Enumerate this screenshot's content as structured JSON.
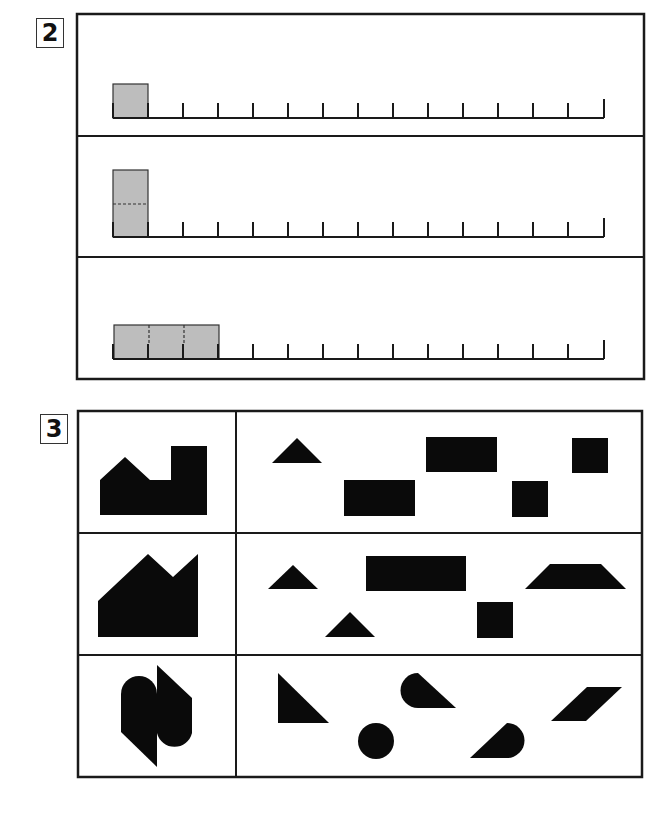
{
  "sections": [
    {
      "number": "2",
      "type": "unit-measurement",
      "rows": [
        {
          "ruler_ticks": 15,
          "tick_spacing_px": 35,
          "shaded_units_wide": 1,
          "shaded_height": "short",
          "dashed_dividers": "none",
          "description": "one shaded square on ruler"
        },
        {
          "ruler_ticks": 15,
          "tick_spacing_px": 35,
          "shaded_units_wide": 1,
          "shaded_height": "tall",
          "dashed_dividers": "horizontal at middle",
          "description": "tall rectangle made of two stacked units"
        },
        {
          "ruler_ticks": 15,
          "tick_spacing_px": 35,
          "shaded_units_wide": 3,
          "shaded_height": "short",
          "dashed_dividers": "two vertical",
          "description": "rectangle three units wide"
        }
      ],
      "colors": {
        "shade": "#bdbdbd",
        "line": "#1a1a1a"
      }
    },
    {
      "number": "3",
      "type": "shape-composition",
      "rows": [
        {
          "target": "house-with-tower silhouette",
          "pieces": [
            "triangle",
            "rectangle",
            "rectangle",
            "square",
            "square"
          ]
        },
        {
          "target": "double-peak factory silhouette",
          "pieces": [
            "triangle",
            "rectangle",
            "trapezoid",
            "triangle",
            "square"
          ]
        },
        {
          "target": "interlocking rounded S silhouette",
          "pieces": [
            "right-triangle",
            "teardrop",
            "parallelogram",
            "circle",
            "teardrop"
          ]
        }
      ],
      "colors": {
        "fill": "#0a0a0a"
      }
    }
  ]
}
